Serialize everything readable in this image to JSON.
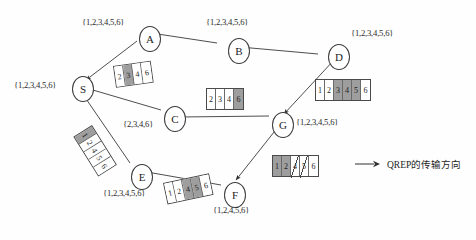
{
  "diagram": {
    "nodes": [
      {
        "id": "A",
        "label": "A",
        "set": "{1,2,3,4,5,6}",
        "x": 139,
        "y": 26,
        "label_x": 82,
        "label_y": 17
      },
      {
        "id": "B",
        "label": "B",
        "set": "{1,2,3,4,5,6}",
        "x": 228,
        "y": 38,
        "label_x": 206,
        "label_y": 17
      },
      {
        "id": "D",
        "label": "D",
        "set": "{1,2,3,4,5,6}",
        "x": 328,
        "y": 44,
        "label_x": 351,
        "label_y": 28
      },
      {
        "id": "S",
        "label": "S",
        "set": "{1,2,3,4,5,6}",
        "x": 72,
        "y": 76,
        "label_x": 14,
        "label_y": 80
      },
      {
        "id": "C",
        "label": "C",
        "set": "{2,3,4,6}",
        "x": 164,
        "y": 106,
        "label_x": 123,
        "label_y": 119
      },
      {
        "id": "G",
        "label": "G",
        "set": "{1,2,3,4,5,6}",
        "x": 272,
        "y": 112,
        "label_x": 296,
        "label_y": 117
      },
      {
        "id": "E",
        "label": "E",
        "set": "{1,2,3,4,5,6}",
        "x": 131,
        "y": 164,
        "label_x": 103,
        "label_y": 188
      },
      {
        "id": "F",
        "label": "F",
        "set": "{1,2,4,5,6}",
        "x": 224,
        "y": 182,
        "label_x": 213,
        "label_y": 205
      }
    ],
    "edges": [
      {
        "from": "A",
        "to": "B",
        "name": "edge-a-b"
      },
      {
        "from": "B",
        "to": "D",
        "name": "edge-b-d"
      },
      {
        "from": "A",
        "to": "S",
        "name": "edge-a-s"
      },
      {
        "from": "D",
        "to": "G",
        "name": "edge-d-g"
      },
      {
        "from": "G",
        "to": "C",
        "name": "edge-g-c"
      },
      {
        "from": "C",
        "to": "S",
        "name": "edge-c-s"
      },
      {
        "from": "G",
        "to": "F",
        "name": "edge-g-f"
      },
      {
        "from": "F",
        "to": "E",
        "name": "edge-f-e"
      },
      {
        "from": "E",
        "to": "S",
        "name": "edge-e-s"
      }
    ],
    "packets": [
      {
        "name": "packet-a-to-s",
        "x": 113,
        "y": 66,
        "rotate": -8,
        "cells": [
          {
            "value": "2",
            "shaded": false
          },
          {
            "value": "3",
            "shaded": true
          },
          {
            "value": "4",
            "shaded": false
          },
          {
            "value": "6",
            "shaded": false
          }
        ]
      },
      {
        "name": "packet-g-to-c",
        "x": 206,
        "y": 88,
        "rotate": 0,
        "cells": [
          {
            "value": "2",
            "shaded": false
          },
          {
            "value": "3",
            "shaded": false
          },
          {
            "value": "4",
            "shaded": false
          },
          {
            "value": "6",
            "shaded": true
          }
        ]
      },
      {
        "name": "packet-d-to-g",
        "x": 315,
        "y": 79,
        "rotate": 0,
        "cells": [
          {
            "value": "1",
            "shaded": false
          },
          {
            "value": "2",
            "shaded": false
          },
          {
            "value": "3",
            "shaded": true
          },
          {
            "value": "4",
            "shaded": true
          },
          {
            "value": "5",
            "shaded": true
          },
          {
            "value": "6",
            "shaded": false
          }
        ]
      },
      {
        "name": "packet-g-to-f",
        "x": 272,
        "y": 155,
        "rotate": 0,
        "cells": [
          {
            "value": "1",
            "shaded": true
          },
          {
            "value": "2",
            "shaded": true
          },
          {
            "value": "4",
            "shaded": false,
            "struck": true
          },
          {
            "value": "5",
            "shaded": false,
            "struck": true
          },
          {
            "value": "6",
            "shaded": false
          }
        ]
      },
      {
        "name": "packet-f-to-e",
        "x": 163,
        "y": 183,
        "rotate": -12,
        "cells": [
          {
            "value": "1",
            "shaded": false
          },
          {
            "value": "2",
            "shaded": false
          },
          {
            "value": "4",
            "shaded": true
          },
          {
            "value": "5",
            "shaded": true
          },
          {
            "value": "6",
            "shaded": false
          }
        ]
      },
      {
        "name": "packet-e-to-s",
        "x": 92,
        "y": 125,
        "rotate": 58,
        "cells": [
          {
            "value": "1",
            "shaded": true
          },
          {
            "value": "2",
            "shaded": false
          },
          {
            "value": "4",
            "shaded": false
          },
          {
            "value": "5",
            "shaded": false
          },
          {
            "value": "6",
            "shaded": false
          }
        ]
      }
    ],
    "legend": {
      "x": 355,
      "y": 157,
      "arrow_name": "legend-arrow-icon",
      "text": "QREP的传输方向"
    }
  }
}
